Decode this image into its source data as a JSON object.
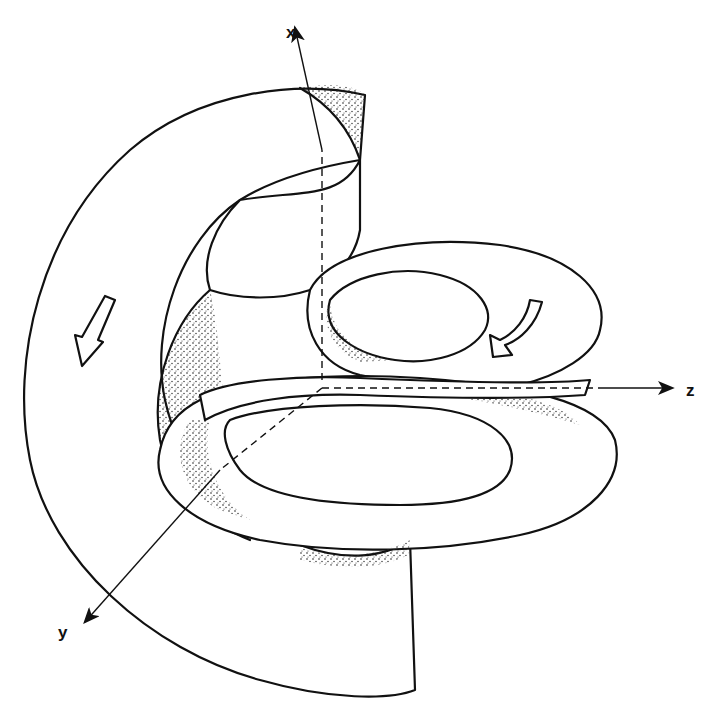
{
  "figure": {
    "axes": {
      "x_label": "x",
      "y_label": "y",
      "z_label": "z"
    },
    "annotations": [
      {
        "type": "hollow-arrow",
        "name": "flow-arrow-left",
        "direction": "down"
      },
      {
        "type": "hollow-arrow",
        "name": "flow-arrow-right",
        "direction": "down-left"
      }
    ],
    "colors": {
      "line": "#111111",
      "background": "#ffffff"
    }
  }
}
